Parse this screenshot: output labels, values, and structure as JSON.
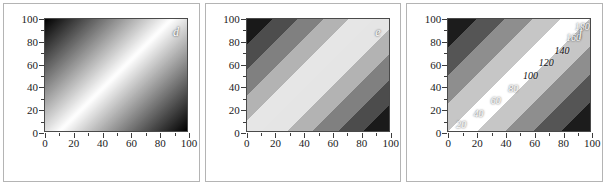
{
  "figure": {
    "background": "#ffffff",
    "panel_border_color": "#b4b4b4",
    "axis_color": "#3c3c3c"
  },
  "axes": {
    "x_ticks": [
      "0",
      "20",
      "40",
      "60",
      "80",
      "100"
    ],
    "y_ticks": [
      "0",
      "20",
      "40",
      "60",
      "80",
      "100"
    ],
    "x_minor_step": 10,
    "y_minor_step": 10,
    "xlim": [
      0,
      100
    ],
    "ylim": [
      0,
      100
    ]
  },
  "panels": [
    {
      "letter": "d",
      "letter_color": "#ffffff",
      "style": "continuous",
      "levels": 0,
      "labels": []
    },
    {
      "letter": "e",
      "letter_color": "#ffffff",
      "style": "banded",
      "levels": 10,
      "labels": []
    },
    {
      "letter": "f",
      "letter_color": "#ffffff",
      "style": "banded-labeled",
      "levels": 9,
      "labels": [
        {
          "text": "20",
          "x": 9,
          "y": 7,
          "tone": "light"
        },
        {
          "text": "40",
          "x": 21,
          "y": 17,
          "tone": "light"
        },
        {
          "text": "60",
          "x": 33,
          "y": 28,
          "tone": "light"
        },
        {
          "text": "80",
          "x": 45,
          "y": 39,
          "tone": "light"
        },
        {
          "text": "100",
          "x": 57,
          "y": 50,
          "tone": "dark"
        },
        {
          "text": "120",
          "x": 68,
          "y": 61,
          "tone": "dark"
        },
        {
          "text": "140",
          "x": 79,
          "y": 72,
          "tone": "dark"
        },
        {
          "text": "160",
          "x": 87,
          "y": 83,
          "tone": "light"
        },
        {
          "text": "180",
          "x": 93,
          "y": 93,
          "tone": "light"
        }
      ]
    }
  ],
  "chart_data": {
    "type": "heatmap",
    "title": "",
    "xlabel": "",
    "ylabel": "",
    "xlim": [
      0,
      100
    ],
    "ylim": [
      0,
      100
    ],
    "grid": false,
    "legend": "none",
    "colormap": "grayscale",
    "function": "z = x + y",
    "zlim": [
      0,
      200
    ],
    "x_ticks": [
      0,
      20,
      40,
      60,
      80,
      100
    ],
    "y_ticks": [
      0,
      20,
      40,
      60,
      80,
      100
    ],
    "panels": [
      {
        "label": "d",
        "rendering": "continuous gradient",
        "contour_levels": [],
        "description": "Smooth grayscale gradient of z = x + y; dark at bottom-left and top-right corners, bright band along the anti-diagonal ridge running from lower-left to upper-right."
      },
      {
        "label": "e",
        "rendering": "discrete bands",
        "n_levels": 10,
        "contour_levels": [
          20,
          40,
          60,
          80,
          100,
          120,
          140,
          160,
          180
        ],
        "description": "Same field quantized into 10 uniform grayscale bands with sharp edges."
      },
      {
        "label": "f",
        "rendering": "discrete bands with contour labels",
        "n_levels": 9,
        "contour_levels": [
          20,
          40,
          60,
          80,
          100,
          120,
          140,
          160,
          180
        ],
        "labeled_contours": [
          20,
          40,
          60,
          80,
          100,
          120,
          140,
          160,
          180
        ],
        "description": "Same field in wide grayscale bands, each contour annotated with its z value in italic text."
      }
    ]
  }
}
